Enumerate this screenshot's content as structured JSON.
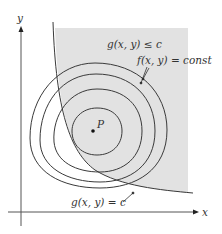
{
  "figure": {
    "axes": {
      "x_label": "x",
      "y_label": "y"
    },
    "region_label": "g(x, y) ≤ c",
    "constraint_curve_label": "g(x, y) = c",
    "level_curves_label": "f(x, y) = const",
    "point_label": "P",
    "level_curve_count": 4,
    "colors": {
      "shade": "#e2e2e2",
      "stroke": "#3a3a3a",
      "background": "#ffffff"
    }
  }
}
